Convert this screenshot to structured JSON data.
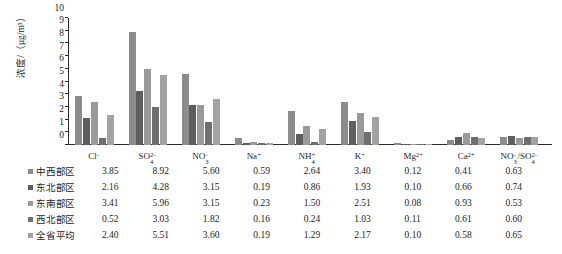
{
  "chart_data": {
    "type": "bar",
    "title": "",
    "xlabel": "",
    "ylabel": "浓度/（μg/m³）",
    "ylim": [
      0,
      10
    ],
    "yticks": [
      0,
      1,
      2,
      3,
      4,
      5,
      6,
      7,
      8,
      9,
      10
    ],
    "grid": false,
    "legend_position": "bottom-table",
    "categories": [
      "Cl⁻",
      "SO₄²⁻",
      "NO₃⁻",
      "Na⁺",
      "NH₄⁺",
      "K⁺",
      "Mg²⁺",
      "Ca²⁺",
      "NO₃⁻/SO₄²⁻"
    ],
    "category_parts": [
      {
        "base": "Cl",
        "sup": "-",
        "sub": ""
      },
      {
        "base": "SO",
        "sup": "2-",
        "sub": "4"
      },
      {
        "base": "NO",
        "sup": "-",
        "sub": "3"
      },
      {
        "base": "Na",
        "sup": "+",
        "sub": ""
      },
      {
        "base": "NH",
        "sup": "+",
        "sub": "4"
      },
      {
        "base": "K",
        "sup": "+",
        "sub": ""
      },
      {
        "base": "Mg",
        "sup": "2+",
        "sub": ""
      },
      {
        "base": "Ca",
        "sup": "2+",
        "sub": ""
      },
      {
        "base": "NO",
        "sup": "-",
        "sub": "3",
        "base2": "/SO",
        "sup2": "2-",
        "sub2": "4"
      }
    ],
    "series": [
      {
        "name": "中西部区",
        "color": "#8c8c8c",
        "values": [
          3.85,
          8.92,
          5.6,
          0.59,
          2.64,
          3.4,
          0.12,
          0.41,
          0.63
        ]
      },
      {
        "name": "东北部区",
        "color": "#5e5e5e",
        "values": [
          2.16,
          4.28,
          3.15,
          0.19,
          0.86,
          1.93,
          0.1,
          0.66,
          0.74
        ]
      },
      {
        "name": "东南部区",
        "color": "#9a9a9a",
        "values": [
          3.41,
          5.96,
          3.15,
          0.23,
          1.5,
          2.51,
          0.08,
          0.93,
          0.53
        ]
      },
      {
        "name": "西北部区",
        "color": "#6f6f6f",
        "values": [
          0.52,
          3.03,
          1.82,
          0.16,
          0.24,
          1.03,
          0.11,
          0.61,
          0.6
        ]
      },
      {
        "name": "全省平均",
        "color": "#a3a3a3",
        "values": [
          2.4,
          5.51,
          3.6,
          0.19,
          1.29,
          2.17,
          0.1,
          0.58,
          0.65
        ]
      }
    ]
  },
  "legend_table": {
    "rows": [
      {
        "label": "中西部区",
        "swatch": "#8c8c8c",
        "values": [
          "3.85",
          "8.92",
          "5.60",
          "0.59",
          "2.64",
          "3.40",
          "0.12",
          "0.41",
          "0.63"
        ]
      },
      {
        "label": "东北部区",
        "swatch": "#5e5e5e",
        "values": [
          "2.16",
          "4.28",
          "3.15",
          "0.19",
          "0.86",
          "1.93",
          "0.10",
          "0.66",
          "0.74"
        ]
      },
      {
        "label": "东南部区",
        "swatch": "#9a9a9a",
        "values": [
          "3.41",
          "5.96",
          "3.15",
          "0.23",
          "1.50",
          "2.51",
          "0.08",
          "0.93",
          "0.53"
        ]
      },
      {
        "label": "西北部区",
        "swatch": "#6f6f6f",
        "values": [
          "0.52",
          "3.03",
          "1.82",
          "0.16",
          "0.24",
          "1.03",
          "0.11",
          "0.61",
          "0.60"
        ]
      },
      {
        "label": "全省平均",
        "swatch": "#a3a3a3",
        "values": [
          "2.40",
          "5.51",
          "3.60",
          "0.19",
          "1.29",
          "2.17",
          "0.10",
          "0.58",
          "0.65"
        ]
      }
    ]
  }
}
